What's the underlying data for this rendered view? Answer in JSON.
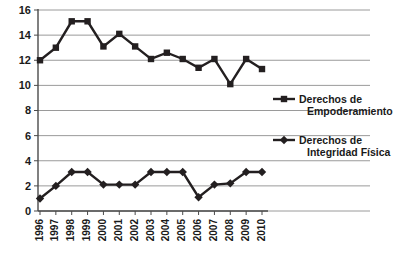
{
  "chart_data": {
    "type": "line",
    "title": "",
    "subtitle": "",
    "xlabel": "",
    "ylabel": "",
    "categories": [
      "1996",
      "1997",
      "1998",
      "1999",
      "2000",
      "2001",
      "2002",
      "2003",
      "2004",
      "2005",
      "2006",
      "2007",
      "2008",
      "2009",
      "2010"
    ],
    "ylim": [
      0,
      16
    ],
    "ytick_labels": [
      "0",
      "2",
      "4",
      "6",
      "8",
      "10",
      "12",
      "14",
      "16"
    ],
    "ytick_values": [
      0,
      2,
      4,
      6,
      8,
      10,
      12,
      14,
      16
    ],
    "grid": "horizontal",
    "legend_position": "right",
    "series": [
      {
        "name": "Derechos de Empoderamiento",
        "marker": "square",
        "color": "#231f20",
        "values": [
          12,
          13,
          15.1,
          15.1,
          13.1,
          14.1,
          13.1,
          12.1,
          12.6,
          12.1,
          11.4,
          12.1,
          10.1,
          12.1,
          11.3
        ]
      },
      {
        "name": "Derechos de Integridad Física",
        "marker": "diamond",
        "color": "#231f20",
        "values": [
          1,
          2,
          3.1,
          3.1,
          2.1,
          2.1,
          2.1,
          3.1,
          3.1,
          3.1,
          1.1,
          2.1,
          2.2,
          3.1,
          3.1
        ]
      }
    ]
  },
  "legend": {
    "items": [
      {
        "label_line1": "Derechos de",
        "label_line2": "Empoderamiento",
        "marker": "square"
      },
      {
        "label_line1": "Derechos de",
        "label_line2": "Integridad Física",
        "marker": "diamond"
      }
    ]
  },
  "colors": {
    "series": "#231f20",
    "grid": "#9a9a9a",
    "axis": "#4a4a4a",
    "background": "#ffffff",
    "text": "#1a1a1a"
  }
}
